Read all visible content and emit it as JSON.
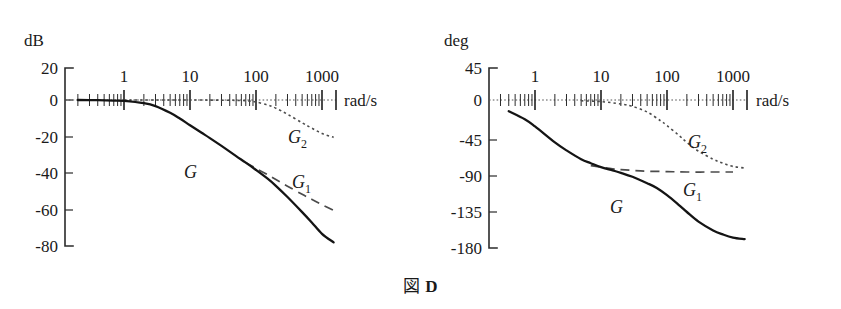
{
  "figure": {
    "caption_mark": "図",
    "caption_id": "D"
  },
  "chart_data": [
    {
      "type": "line",
      "id": "magnitude-plot",
      "title": "",
      "ylabel": "dB",
      "xlabel": "rad/s",
      "xscale": "log",
      "xlim": [
        0.1,
        3000
      ],
      "ylim": [
        -80,
        20
      ],
      "yticks": [
        20,
        0,
        -20,
        -40,
        -60,
        -80
      ],
      "ytick_labels": [
        "20",
        "0",
        "-20",
        "-40",
        "-60",
        "-80"
      ],
      "xticks": [
        1,
        10,
        100,
        1000
      ],
      "xtick_labels": [
        "1",
        "10",
        "100",
        "1000"
      ],
      "grid": false,
      "legend_position": "inline-annotations",
      "series": [
        {
          "name": "G",
          "style": "solid",
          "label_x": 30,
          "label_y": -28,
          "x": [
            0.1,
            0.2,
            0.4,
            0.7,
            1,
            2,
            3,
            5,
            7,
            10,
            15,
            20,
            30,
            50,
            70,
            100,
            150,
            200,
            300,
            500,
            700,
            1000,
            1500,
            2000
          ],
          "y": [
            0,
            0,
            -0.1,
            -0.3,
            -0.5,
            -1.8,
            -3.4,
            -7.2,
            -10.4,
            -14.2,
            -18.4,
            -21.4,
            -25.8,
            -31.5,
            -35.2,
            -39.3,
            -44.2,
            -48.2,
            -54.5,
            -63.0,
            -68.8,
            -75.2,
            -80.0,
            -80.0
          ]
        },
        {
          "name": "G1",
          "style": "dashed",
          "label_x": 400,
          "label_y": -42,
          "x": [
            70,
            100,
            150,
            200,
            300,
            500,
            700,
            1000,
            1500,
            2000
          ],
          "y": [
            -35.2,
            -38.4,
            -42.0,
            -44.6,
            -48.4,
            -53.0,
            -55.8,
            -58.8,
            -62.0,
            -63.5
          ]
        },
        {
          "name": "G2",
          "style": "dotted",
          "label_x": 330,
          "label_y": -21,
          "x": [
            1,
            10,
            50,
            80,
            100,
            150,
            200,
            300,
            500,
            700,
            1000,
            1500,
            2000
          ],
          "y": [
            0,
            0,
            -0.2,
            -0.6,
            -1.1,
            -2.8,
            -4.6,
            -8.0,
            -12.8,
            -15.8,
            -18.8,
            -21.0,
            -21.5
          ]
        }
      ]
    },
    {
      "type": "line",
      "id": "phase-plot",
      "title": "",
      "ylabel": "deg",
      "xlabel": "rad/s",
      "xscale": "log",
      "xlim": [
        0.1,
        3000
      ],
      "ylim": [
        -180,
        45
      ],
      "yticks": [
        45,
        0,
        -45,
        -90,
        -135,
        -180
      ],
      "ytick_labels": [
        "45",
        "0",
        "-45",
        "-90",
        "-135",
        "-180"
      ],
      "xticks": [
        1,
        10,
        100,
        1000
      ],
      "xtick_labels": [
        "1",
        "10",
        "100",
        "1000"
      ],
      "grid": false,
      "legend_position": "inline-annotations",
      "series": [
        {
          "name": "G",
          "style": "solid",
          "label_x": 30,
          "label_y": -122,
          "x": [
            0.1,
            0.2,
            0.4,
            0.7,
            1,
            2,
            3,
            5,
            7,
            10,
            15,
            20,
            30,
            50,
            70,
            100,
            150,
            200,
            300,
            500,
            700,
            1000,
            1500,
            2000
          ],
          "y": [
            -4,
            -7,
            -14,
            -24,
            -33,
            -53,
            -63,
            -74,
            -79,
            -84,
            -88,
            -91,
            -96,
            -104,
            -110,
            -119,
            -131,
            -140,
            -152,
            -163,
            -168,
            -172,
            -174,
            -174
          ]
        },
        {
          "name": "G1",
          "style": "dashed",
          "label_x": 330,
          "label_y": -104,
          "x": [
            7,
            10,
            15,
            20,
            30,
            50,
            100,
            200,
            500,
            1000,
            2000
          ],
          "y": [
            -82,
            -84,
            -86,
            -87,
            -88,
            -89,
            -89.5,
            -90,
            -90,
            -90,
            -90
          ]
        },
        {
          "name": "G2",
          "style": "dotted",
          "label_x": 220,
          "label_y": -52,
          "x": [
            5,
            10,
            20,
            30,
            50,
            80,
            100,
            150,
            200,
            300,
            500,
            700,
            1000,
            1500,
            2000
          ],
          "y": [
            -1,
            -2,
            -5,
            -8,
            -15,
            -26,
            -32,
            -44,
            -53,
            -64,
            -74,
            -79,
            -83,
            -85,
            -86
          ]
        }
      ]
    }
  ],
  "magnitude": {
    "unit_label": "dB",
    "x_unit_label": "rad/s",
    "ytick_labels": [
      "20",
      "0",
      "-20",
      "-40",
      "-60",
      "-80"
    ],
    "xtick_labels": [
      "1",
      "10",
      "100",
      "1000"
    ],
    "curve_labels": {
      "g": "G",
      "g1": "G",
      "g1_sub": "1",
      "g2": "G",
      "g2_sub": "2"
    }
  },
  "phase": {
    "unit_label": "deg",
    "x_unit_label": "rad/s",
    "ytick_labels": [
      "45",
      "0",
      "-45",
      "-90",
      "-135",
      "-180"
    ],
    "xtick_labels": [
      "1",
      "10",
      "100",
      "1000"
    ],
    "curve_labels": {
      "g": "G",
      "g1": "G",
      "g1_sub": "1",
      "g2": "G",
      "g2_sub": "2"
    }
  }
}
